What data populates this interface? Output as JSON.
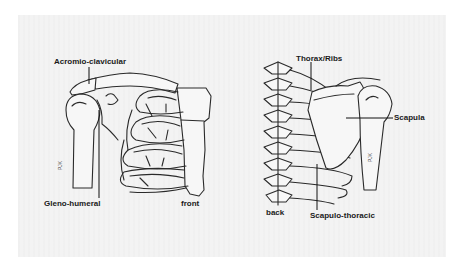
{
  "figure": {
    "panels": [
      {
        "id": "front",
        "view_label": "front",
        "labels": [
          {
            "key": "acromio_clavicular",
            "text": "Acromio-clavicular"
          },
          {
            "key": "gleno_humeral",
            "text": "Gleno-humeral"
          }
        ],
        "signature": "PJK"
      },
      {
        "id": "back",
        "view_label": "back",
        "labels": [
          {
            "key": "thorax_ribs",
            "text": "Thorax/Ribs"
          },
          {
            "key": "scapula",
            "text": "Scapula"
          },
          {
            "key": "scapulo_thoracic",
            "text": "Scapulo-thoracic"
          }
        ],
        "signature": "PJK"
      }
    ]
  },
  "colors": {
    "background": "#ffffff",
    "page": "#f3f3f3",
    "ink": "#2a2a2a"
  }
}
